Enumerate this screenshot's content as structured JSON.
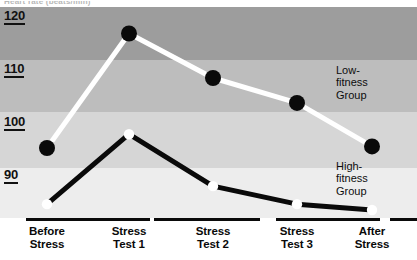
{
  "caption": {
    "top_partial": "Heart rate (beats/min)"
  },
  "chart_data": {
    "type": "line",
    "title": "",
    "subtitle": "",
    "xlabel": "",
    "ylabel": "",
    "categories": [
      "Before Stress",
      "Stress Test 1",
      "Stress Test 2",
      "Stress Test 3",
      "After Stress"
    ],
    "category_lines": [
      [
        "Before",
        "Stress"
      ],
      [
        "Stress",
        "Test 1"
      ],
      [
        "Stress",
        "Test 2"
      ],
      [
        "Stress",
        "Test 3"
      ],
      [
        "After",
        "Stress"
      ]
    ],
    "yticks": [
      120,
      110,
      100,
      90
    ],
    "ylim": [
      85,
      120
    ],
    "grid": false,
    "bands": [
      {
        "from": 110,
        "to": 120,
        "color": "#9d9d9d"
      },
      {
        "from": 100,
        "to": 110,
        "color": "#bdbdbd"
      },
      {
        "from": 90,
        "to": 100,
        "color": "#d6d6d6"
      },
      {
        "from": 80,
        "to": 90,
        "color": "#ededed"
      }
    ],
    "legend_position": "inside-right",
    "series": [
      {
        "name": "Low-fitness Group",
        "name_lines": [
          "Low-",
          "fitness",
          "Group"
        ],
        "color": "#ffffff",
        "marker_color": "#0a0a0a",
        "values": [
          93.4,
          115.0,
          106.6,
          101.9,
          93.7
        ]
      },
      {
        "name": "High-fitness Group",
        "name_lines": [
          "High-",
          "fitness",
          "Group"
        ],
        "color": "#0a0a0a",
        "marker_color": "#ffffff",
        "values": [
          82.8,
          96.0,
          86.2,
          82.8,
          81.7
        ]
      }
    ]
  }
}
